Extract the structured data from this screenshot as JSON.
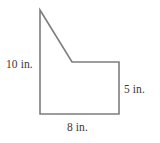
{
  "figure": {
    "name": "composite-polygon-with-notch",
    "units": "in.",
    "stroke_color": "#7d7d7d",
    "stroke_width": 1.6,
    "background_color": "#ffffff",
    "text_color": "#3a3a3a",
    "vertices": [
      {
        "name": "apex-top-left",
        "x": 40,
        "y": 10
      },
      {
        "name": "notch-inner-corner",
        "x": 72,
        "y": 62
      },
      {
        "name": "right-top-corner",
        "x": 119,
        "y": 62
      },
      {
        "name": "bottom-right-corner",
        "x": 119,
        "y": 114
      },
      {
        "name": "bottom-left-corner",
        "x": 40,
        "y": 114
      }
    ],
    "path": "M 40 10 L 72 62 L 119 62 L 119 114 L 40 114 Z"
  },
  "labels": {
    "left_side": "10 in.",
    "right_side": "5 in.",
    "bottom_side": "8 in."
  }
}
